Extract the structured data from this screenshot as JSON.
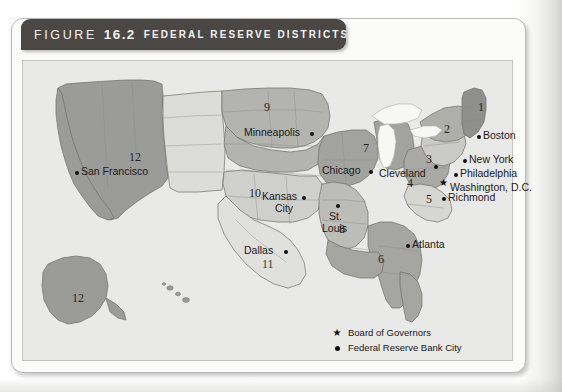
{
  "figure": {
    "label": "FIGURE",
    "number": "16.2",
    "title": "FEDERAL RESERVE DISTRICTS"
  },
  "map": {
    "cities": [
      {
        "name": "Boston",
        "marker": "dot",
        "dot_x": 455,
        "dot_y": 75,
        "label_x": 461,
        "label_y": 69
      },
      {
        "name": "New York",
        "marker": "dot",
        "dot_x": 441,
        "dot_y": 99,
        "label_x": 447,
        "label_y": 93
      },
      {
        "name": "Philadelphia",
        "marker": "dot",
        "dot_x": 432,
        "dot_y": 113,
        "label_x": 438,
        "label_y": 107
      },
      {
        "name": "Washington, D.C.",
        "marker": "star",
        "dot_x": 418,
        "dot_y": 123,
        "label_x": 428,
        "label_y": 121
      },
      {
        "name": "Richmond",
        "marker": "dot",
        "dot_x": 420,
        "dot_y": 137,
        "label_x": 426,
        "label_y": 131
      },
      {
        "name": "Cleveland",
        "marker": "dot",
        "dot_x": 412,
        "dot_y": 105,
        "label_x": 367,
        "label_y": 107
      },
      {
        "name": "Chicago",
        "marker": "dot",
        "dot_x": 347,
        "dot_y": 110,
        "label_x": 300,
        "label_y": 104
      },
      {
        "name": "Minneapolis",
        "marker": "dot",
        "dot_x": 288,
        "dot_y": 72,
        "label_x": 229,
        "label_y": 66
      },
      {
        "name": "Kansas City",
        "marker": "dot",
        "dot_x": 280,
        "dot_y": 136,
        "label_x": 231,
        "label_y": 130
      },
      {
        "name": "St. Louis",
        "marker": "dot",
        "dot_x": 314,
        "dot_y": 144,
        "label_x": 302,
        "label_y": 148
      },
      {
        "name": "Dallas",
        "marker": "dot",
        "dot_x": 262,
        "dot_y": 190,
        "label_x": 220,
        "label_y": 184
      },
      {
        "name": "Atlanta",
        "marker": "dot",
        "dot_x": 384,
        "dot_y": 184,
        "label_x": 390,
        "label_y": 178
      },
      {
        "name": "San Francisco",
        "marker": "dot",
        "dot_x": 53,
        "dot_y": 111,
        "label_x": 59,
        "label_y": 105
      }
    ],
    "city_labels_wrapped": {
      "kansas_city_line1": "Kansas",
      "kansas_city_line2": "City",
      "st_louis_line1": "St.",
      "st_louis_line2": "Louis"
    },
    "districts": [
      {
        "number": "1",
        "x": 456,
        "y": 46
      },
      {
        "number": "2",
        "x": 422,
        "y": 68
      },
      {
        "number": "3",
        "x": 404,
        "y": 98
      },
      {
        "number": "4",
        "x": 385,
        "y": 122
      },
      {
        "number": "5",
        "x": 404,
        "y": 138
      },
      {
        "number": "6",
        "x": 356,
        "y": 198
      },
      {
        "number": "7",
        "x": 341,
        "y": 87
      },
      {
        "number": "8",
        "x": 317,
        "y": 168
      },
      {
        "number": "9",
        "x": 242,
        "y": 46
      },
      {
        "number": "10",
        "x": 227,
        "y": 132
      },
      {
        "number": "11",
        "x": 240,
        "y": 203
      },
      {
        "number": "12",
        "x": 107,
        "y": 96
      },
      {
        "number": "12",
        "x": 50,
        "y": 237
      }
    ],
    "legend": [
      {
        "marker": "star",
        "text": "Board of Governors"
      },
      {
        "marker": "dot",
        "text": "Federal Reserve Bank City"
      }
    ]
  },
  "colors": {
    "header_bar": "#4a4745",
    "header_text": "#f4f3f1",
    "map_background": "#e9e9e7",
    "district_dark": "#9b9b99",
    "district_mid": "#b5b5b2",
    "district_light": "#cfcfcc",
    "district_pale": "#e2e2df",
    "water": "#f6f6f4",
    "border": "#6e6e6c",
    "marker": "#111111"
  }
}
